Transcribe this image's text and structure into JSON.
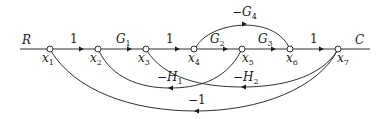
{
  "diagram": {
    "type": "signal-flow-graph",
    "input_label": "R",
    "output_label": "C",
    "nodes": [
      {
        "id": "x1",
        "base": "x",
        "sub": "1",
        "x": 50,
        "y": 49
      },
      {
        "id": "x2",
        "base": "x",
        "sub": "2",
        "x": 98,
        "y": 49
      },
      {
        "id": "x3",
        "base": "x",
        "sub": "3",
        "x": 146,
        "y": 49
      },
      {
        "id": "x4",
        "base": "x",
        "sub": "4",
        "x": 194,
        "y": 49
      },
      {
        "id": "x5",
        "base": "x",
        "sub": "5",
        "x": 242,
        "y": 49
      },
      {
        "id": "x6",
        "base": "x",
        "sub": "6",
        "x": 290,
        "y": 49
      },
      {
        "id": "x7",
        "base": "x",
        "sub": "7",
        "x": 338,
        "y": 49
      }
    ],
    "branches": [
      {
        "from": "x1",
        "to": "x2",
        "gain": "1",
        "label_base": "1",
        "label_sub": ""
      },
      {
        "from": "x2",
        "to": "x3",
        "gain": "G1",
        "label_base": "G",
        "label_sub": "1"
      },
      {
        "from": "x3",
        "to": "x4",
        "gain": "1",
        "label_base": "1",
        "label_sub": ""
      },
      {
        "from": "x4",
        "to": "x5",
        "gain": "G2",
        "label_base": "G",
        "label_sub": "2"
      },
      {
        "from": "x5",
        "to": "x6",
        "gain": "G3",
        "label_base": "G",
        "label_sub": "3"
      },
      {
        "from": "x6",
        "to": "x7",
        "gain": "1",
        "label_base": "1",
        "label_sub": ""
      },
      {
        "from": "x4",
        "to": "x6",
        "gain": "-G4",
        "label_base": "−G",
        "label_sub": "4"
      },
      {
        "from": "x5",
        "to": "x2",
        "gain": "-H1",
        "label_base": "−H",
        "label_sub": "1"
      },
      {
        "from": "x7",
        "to": "x3",
        "gain": "-H2",
        "label_base": "−H",
        "label_sub": "2"
      },
      {
        "from": "x7",
        "to": "x1",
        "gain": "-1",
        "label_base": "−1",
        "label_sub": ""
      }
    ]
  }
}
